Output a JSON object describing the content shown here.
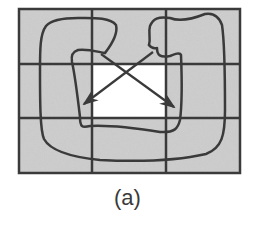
{
  "figure": {
    "caption": "(a)",
    "grid": {
      "rows": 3,
      "cols": 3,
      "highlighted_cell": "center"
    },
    "colors": {
      "cell_fill": "#c8c8c8",
      "highlight_fill": "#ffffff",
      "line": "#3a3a3a"
    },
    "arrows": [
      {
        "from": "top-center region",
        "to": "center-left cell",
        "direction": "down-left"
      },
      {
        "from": "top-right region",
        "to": "center-right cell",
        "direction": "down-right"
      }
    ]
  }
}
